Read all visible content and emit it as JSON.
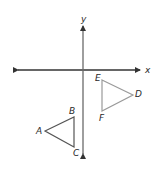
{
  "diagram": {
    "type": "coordinate-plane",
    "axes": {
      "x_label": "x",
      "y_label": "y",
      "color": "#333333"
    },
    "triangles": [
      {
        "name": "triangle-ABC",
        "stroke": "#555555",
        "vertices": [
          {
            "label": "A"
          },
          {
            "label": "B"
          },
          {
            "label": "C"
          }
        ]
      },
      {
        "name": "triangle-EDF",
        "stroke": "#9a9a9a",
        "vertices": [
          {
            "label": "E"
          },
          {
            "label": "D"
          },
          {
            "label": "F"
          }
        ]
      }
    ]
  }
}
